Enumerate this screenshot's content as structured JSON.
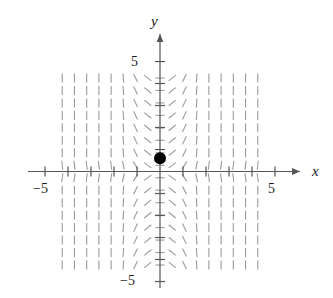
{
  "figure": {
    "kind": "slope-field",
    "background": "#ffffff"
  },
  "axes": {
    "x_axis_label": "x",
    "y_axis_label": "y",
    "x_tick_labels": [
      {
        "name": "x-neg-5",
        "text": "−5",
        "value": -5
      },
      {
        "name": "x-pos-5",
        "text": "5",
        "value": 5
      }
    ],
    "y_tick_labels": [
      {
        "name": "y-pos-5",
        "text": "5",
        "value": 5
      },
      {
        "name": "y-neg-5",
        "text": "−5",
        "value": -5
      }
    ],
    "tick_values": [
      -5,
      -4,
      -3,
      -2,
      -1,
      1,
      2,
      3,
      4,
      5
    ],
    "axis_color": "#555555",
    "axis_width": 1.2,
    "origin_px": {
      "x": 160,
      "y": 171.5
    },
    "scale_px_per_unit": {
      "x": 23.0,
      "y": 22.0
    },
    "x_axis_range_px": {
      "from": 28,
      "to": 300
    },
    "y_axis_range_px": {
      "from": 288,
      "to": 34
    },
    "tick_half_length_px": 5
  },
  "chart_data": {
    "type": "scatter",
    "title": "",
    "xlabel": "x",
    "ylabel": "y",
    "xlim": [
      -5.9,
      6.1
    ],
    "ylim": [
      -5.3,
      6.3
    ],
    "grid": false,
    "legend": null,
    "slope_field": {
      "description": "Direction field of dy/dx = -x*y/(1+x^2)-style flow: near-vertical segments far from the y-axis, flattening toward horizontal near the y-axis; slopes negative in quadrants II and IV, positive in quadrants I and III.",
      "x_min": -4.25,
      "x_max": 4.25,
      "y_min": -4.25,
      "y_max": 4.25,
      "columns": 17,
      "rows": 16,
      "dash_color": "#9a9a9a",
      "dash_length_px": 9,
      "dash_width": 1.1
    },
    "points": [
      {
        "name": "initial-condition-point",
        "x": 0,
        "y": 0.6,
        "color": "#000000",
        "radius_px": 6
      }
    ]
  }
}
